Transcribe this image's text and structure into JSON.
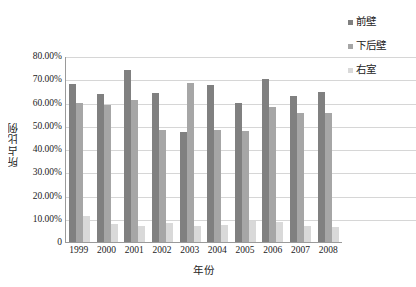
{
  "chart_data": {
    "type": "bar",
    "title": "",
    "subtitle": "",
    "xlabel": "年份",
    "ylabel": "所占比例",
    "categories": [
      "1999",
      "2000",
      "2001",
      "2002",
      "2003",
      "2004",
      "2005",
      "2006",
      "2007",
      "2008"
    ],
    "series": [
      {
        "name": "前壁",
        "color": "#808080",
        "values": [
          67.8,
          63.6,
          73.9,
          64.1,
          47.5,
          67.7,
          59.8,
          70.3,
          62.6,
          64.4
        ]
      },
      {
        "name": "下后壁",
        "color": "#a6a6a6",
        "values": [
          59.8,
          59.1,
          61.2,
          48.0,
          68.3,
          48.0,
          47.7,
          58.2,
          55.6,
          55.7
        ]
      },
      {
        "name": "右室",
        "color": "#d9d9d9",
        "values": [
          11.2,
          7.6,
          6.7,
          8.2,
          7.0,
          7.5,
          8.9,
          8.4,
          6.8,
          6.4
        ]
      }
    ],
    "ylim": [
      0,
      80
    ],
    "yticks": [
      0,
      10,
      20,
      30,
      40,
      50,
      60,
      70,
      80
    ],
    "ytick_labels": [
      "0",
      "10.00%",
      "20.00%",
      "30.00%",
      "40.00%",
      "50.00%",
      "60.00%",
      "70.00%",
      "80.00%"
    ],
    "grid": true,
    "grid_axis": "y",
    "legend_position": "right-top",
    "value_unit": "percent"
  },
  "legend": {
    "items": [
      {
        "label": "前壁",
        "color": "#808080"
      },
      {
        "label": "下后壁",
        "color": "#a6a6a6"
      },
      {
        "label": "右室",
        "color": "#d9d9d9"
      }
    ]
  },
  "axes": {
    "y_title": "所占比例",
    "x_title": "年份"
  }
}
